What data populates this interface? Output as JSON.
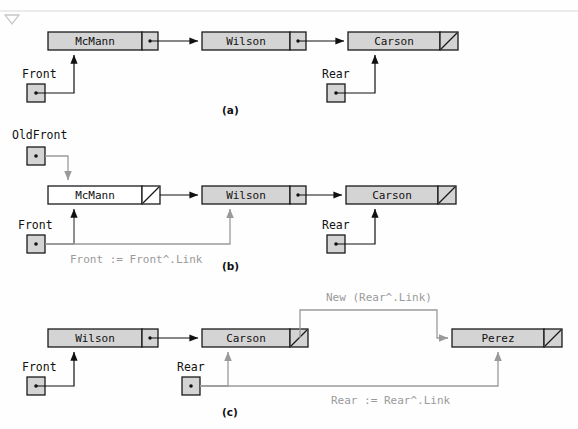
{
  "figure": {
    "title_marker": "triangle-down-marker",
    "colors": {
      "node_fill_gray": "#d4d4d4",
      "node_fill_white": "#ffffff",
      "node_stroke": "#1a1a1a",
      "arrow_black": "#111111",
      "arrow_gray": "#9a9a9a",
      "annotation_text": "#9a9a9a",
      "text": "#111111",
      "background": "#fefefe"
    }
  },
  "panels": [
    {
      "id": "a",
      "caption": "(a)",
      "nodes": [
        {
          "name": "McMann",
          "fill": "gray",
          "link": "pointer"
        },
        {
          "name": "Wilson",
          "fill": "gray",
          "link": "pointer"
        },
        {
          "name": "Carson",
          "fill": "gray",
          "link": "nil"
        }
      ],
      "pointers": [
        {
          "label": "Front",
          "target": "McMann",
          "color": "black"
        },
        {
          "label": "Rear",
          "target": "Carson",
          "color": "black"
        }
      ],
      "annotations": []
    },
    {
      "id": "b",
      "caption": "(b)",
      "nodes": [
        {
          "name": "McMann",
          "fill": "white",
          "link": "nil"
        },
        {
          "name": "Wilson",
          "fill": "gray",
          "link": "pointer"
        },
        {
          "name": "Carson",
          "fill": "gray",
          "link": "nil"
        }
      ],
      "pointers": [
        {
          "label": "OldFront",
          "target": "McMann",
          "color": "gray"
        },
        {
          "label": "Front",
          "target": "Wilson",
          "color": "gray"
        },
        {
          "label": "Rear",
          "target": "Carson",
          "color": "black"
        }
      ],
      "annotations": [
        {
          "text": "Front := Front^.Link",
          "color": "gray"
        }
      ]
    },
    {
      "id": "c",
      "caption": "(c)",
      "nodes": [
        {
          "name": "Wilson",
          "fill": "gray",
          "link": "pointer"
        },
        {
          "name": "Carson",
          "fill": "gray",
          "link": "nil"
        },
        {
          "name": "Perez",
          "fill": "gray",
          "link": "nil"
        }
      ],
      "pointers": [
        {
          "label": "Front",
          "target": "Wilson",
          "color": "black"
        },
        {
          "label": "Rear",
          "target": "Carson",
          "color": "gray"
        }
      ],
      "annotations": [
        {
          "text": "New (Rear^.Link)",
          "color": "gray"
        },
        {
          "text": "Rear := Rear^.Link",
          "color": "gray"
        }
      ]
    }
  ],
  "labels": {
    "mcmann": "McMann",
    "wilson": "Wilson",
    "carson": "Carson",
    "perez": "Perez",
    "front": "Front",
    "oldfront": "OldFront",
    "rear": "Rear",
    "caption_a": "(a)",
    "caption_b": "(b)",
    "caption_c": "(c)",
    "ann_front_link": "Front := Front^.Link",
    "ann_new_rear_link": "New (Rear^.Link)",
    "ann_rear_link": "Rear := Rear^.Link"
  }
}
